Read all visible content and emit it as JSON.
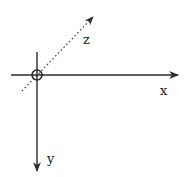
{
  "diagram": {
    "colors": {
      "line": "#2a2a2a",
      "background": "#ffffff"
    },
    "origin": {
      "x": 37,
      "y": 75,
      "marker": "circle-crosshair",
      "radius": 5
    },
    "axes": [
      {
        "name": "x",
        "label": "x",
        "style": "solid",
        "direction": "right",
        "from": [
          11,
          75
        ],
        "to": [
          179,
          75
        ]
      },
      {
        "name": "y",
        "label": "y",
        "style": "solid",
        "direction": "down",
        "from": [
          37,
          52
        ],
        "to": [
          37,
          172
        ]
      },
      {
        "name": "z",
        "label": "z",
        "style": "dotted",
        "direction": "up-right (into page)",
        "from": [
          22,
          91
        ],
        "to": [
          95,
          15
        ]
      }
    ],
    "labels": {
      "x": "x",
      "y": "y",
      "z": "z"
    }
  }
}
